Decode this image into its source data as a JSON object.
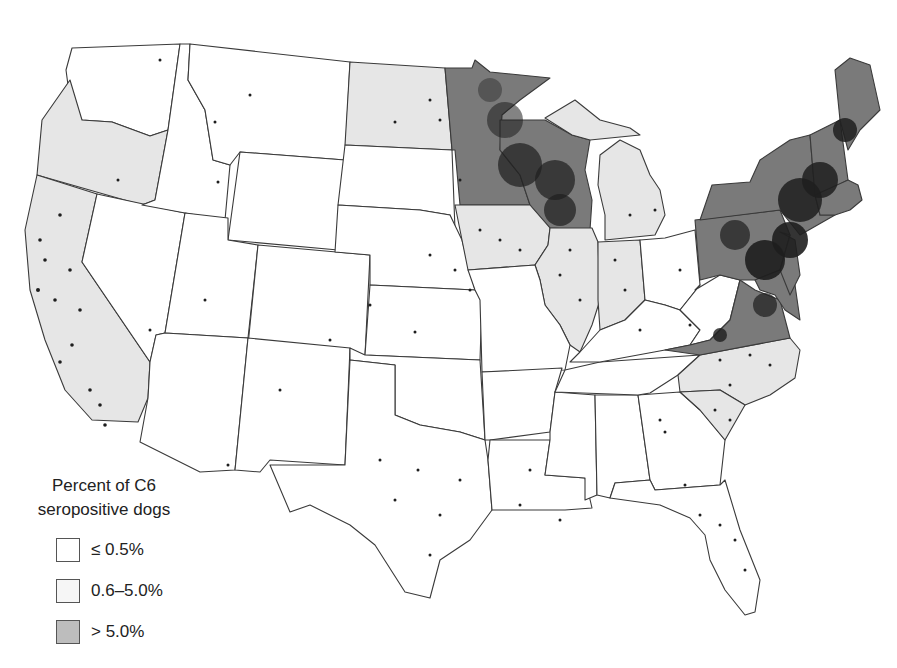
{
  "map": {
    "title": "Percent of C6 seropositive dogs by state (contiguous United States)",
    "colors": {
      "low": "#ffffff",
      "mid": "#e6e6e6",
      "high": "#7a7a7a",
      "dots": "#1e1e1e",
      "border": "#3a3a3a"
    },
    "categories": {
      "high": [
        "Minnesota",
        "Wisconsin",
        "Maine",
        "New Hampshire",
        "Vermont",
        "Massachusetts",
        "Rhode Island",
        "Connecticut",
        "New York",
        "New Jersey",
        "Pennsylvania",
        "Delaware",
        "Maryland",
        "Virginia"
      ],
      "mid": [
        "Washington?",
        "Oregon",
        "California",
        "North Dakota",
        "Iowa",
        "Illinois",
        "Indiana",
        "Michigan",
        "North Carolina",
        "South Carolina"
      ],
      "low": [
        "Idaho",
        "Montana",
        "Wyoming",
        "Nevada",
        "Utah",
        "Colorado",
        "Arizona",
        "New Mexico",
        "South Dakota",
        "Nebraska",
        "Kansas",
        "Oklahoma",
        "Texas",
        "Missouri",
        "Arkansas",
        "Louisiana",
        "Mississippi",
        "Alabama",
        "Georgia",
        "Florida",
        "Tennessee",
        "Kentucky",
        "Ohio",
        "West Virginia"
      ]
    }
  },
  "legend": {
    "title_line1": "Percent of C6",
    "title_line2": "seropositive dogs",
    "items": [
      {
        "label": "≤ 0.5%",
        "color": "#ffffff"
      },
      {
        "label": "0.6–5.0%",
        "color": "#e6e6e6"
      },
      {
        "label": "> 5.0%",
        "color": "#7a7a7a"
      }
    ]
  }
}
